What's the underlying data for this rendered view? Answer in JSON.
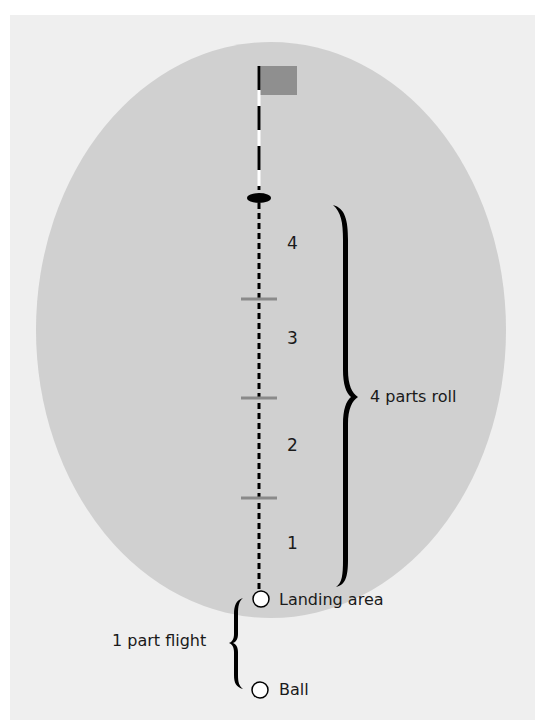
{
  "diagram": {
    "colors": {
      "background": "#efefef",
      "green": "#d0d0d0",
      "flag": "#8f8f8f",
      "tick": "#8a8a8a",
      "ink": "#000000"
    },
    "segments": [
      {
        "label": "4"
      },
      {
        "label": "3"
      },
      {
        "label": "2"
      },
      {
        "label": "1"
      }
    ],
    "roll_label": "4 parts roll",
    "flight_label": "1 part flight",
    "landing_label": "Landing area",
    "ball_label": "Ball",
    "icons": [
      "flag-icon",
      "hole-icon",
      "landing-ball-icon",
      "ball-icon"
    ]
  }
}
